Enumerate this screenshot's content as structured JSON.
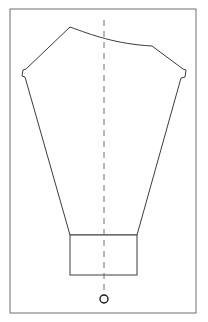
{
  "diagram": {
    "type": "sewing-pattern-block",
    "frame": {
      "label": "drawing-border",
      "x": 10,
      "y": 9,
      "width": 186,
      "height": 304,
      "stroke_color": "#7a7a7a"
    },
    "piece": {
      "label": "bodice-front-panel",
      "stroke_color": "#3c3c3c",
      "fill_color": "#ffffff",
      "path": "M 70 27 C 92 35, 116 44, 152 46 L 183 69 L 186 70 L 185 77 L 181 78 L 137 235 L 70 235 L 25 77 L 22 76 L 23 70 L 26 69 Z"
    },
    "hem": {
      "label": "hem-band",
      "x": 70,
      "y": 235,
      "width": 67,
      "height": 40,
      "stroke_color": "#3c3c3c"
    },
    "center_line": {
      "label": "center-front-fold-line",
      "x": 104,
      "y_start": 20,
      "y_end": 290,
      "style": "dashed",
      "stroke_color": "#6e6e6e"
    },
    "grain_mark": {
      "label": "O",
      "symbol": "circle",
      "cx": 104,
      "cy": 299,
      "r": 4,
      "stroke_color": "#1a1a1a"
    }
  }
}
